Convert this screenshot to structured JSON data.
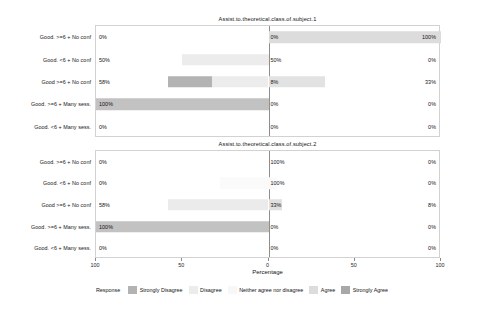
{
  "chart_data": {
    "type": "bar",
    "subtype": "diverging-stacked-likert",
    "title": "",
    "xlabel": "Percentage",
    "ylabel": "",
    "xlim": [
      -100,
      100
    ],
    "xticks": [
      -100,
      -50,
      0,
      50,
      100
    ],
    "xticklabels": [
      "100",
      "50",
      "0",
      "50",
      "100"
    ],
    "grid": false,
    "legend_position": "bottom",
    "legend_title": "Response",
    "categories_legend": [
      "Strongly Disagree",
      "Disagree",
      "Neither agree nor disagree",
      "Agree",
      "Strongly Agree"
    ],
    "colors": {
      "strongly_disagree": "#b3b3b3",
      "disagree": "#ececec",
      "neither": "#f7f7f7",
      "agree": "#dcdcdc",
      "strongly_agree": "#a8a8a8",
      "panel_border": "#d2d2d2",
      "zero_line": "#8e8e8e",
      "background": "#ffffff",
      "text": "#141414"
    },
    "panels": [
      {
        "title": "Assist.to.theoretical.class.of.subject.1",
        "categories": [
          "Good. >=6 + No conf",
          "Good. <6 + No conf",
          "Good >=6 + No conf",
          "Good. >=6 + Many sess.",
          "Good. <6 + Many sess."
        ],
        "rows": [
          {
            "label": "Good. >=6 + No conf",
            "left_pct": "0%",
            "center_pct": "0%",
            "right_pct": "100%",
            "left_value": 0,
            "center_value": 0,
            "right_value": 100,
            "segments": [
              {
                "response": "Agree",
                "start": 0,
                "end": 100,
                "color": "#dcdcdc"
              }
            ]
          },
          {
            "label": "Good. <6 + No conf",
            "left_pct": "50%",
            "center_pct": "50%",
            "right_pct": "0%",
            "left_value": 50,
            "center_value": 50,
            "right_value": 0,
            "segments": [
              {
                "response": "Disagree",
                "start": -50,
                "end": 0,
                "color": "#ececec"
              }
            ]
          },
          {
            "label": "Good >=6 + No conf",
            "left_pct": "58%",
            "center_pct": "8%",
            "right_pct": "33%",
            "left_value": 58,
            "center_value": 8,
            "right_value": 33,
            "segments": [
              {
                "response": "Strongly Disagree",
                "start": -58,
                "end": -33,
                "color": "#b3b3b3"
              },
              {
                "response": "Disagree",
                "start": -33,
                "end": 0,
                "color": "#ececec"
              },
              {
                "response": "Agree",
                "start": 0,
                "end": 33,
                "color": "#e2e2e2"
              }
            ]
          },
          {
            "label": "Good. >=6 + Many sess.",
            "left_pct": "100%",
            "center_pct": "0%",
            "right_pct": "0%",
            "left_value": 100,
            "center_value": 0,
            "right_value": 0,
            "segments": [
              {
                "response": "Strongly Disagree",
                "start": -100,
                "end": 0,
                "color": "#c2c2c2"
              }
            ]
          },
          {
            "label": "Good. <6 + Many sess.",
            "left_pct": "0%",
            "center_pct": "0%",
            "right_pct": "0%",
            "left_value": 0,
            "center_value": 0,
            "right_value": 0,
            "segments": []
          }
        ]
      },
      {
        "title": "Assist.to.theoretical.class.of.subject.2",
        "categories": [
          "Good. >=6 + No conf",
          "Good. <6 + No conf",
          "Good >=6 + No conf",
          "Good. >=6 + Many sess.",
          "Good. <6 + Many sess."
        ],
        "rows": [
          {
            "label": "Good. >=6 + No conf",
            "left_pct": "0%",
            "center_pct": "100%",
            "right_pct": "0%",
            "left_value": 0,
            "center_value": 100,
            "right_value": 0,
            "segments": []
          },
          {
            "label": "Good. <6 + No conf",
            "left_pct": "0%",
            "center_pct": "100%",
            "right_pct": "0%",
            "left_value": 0,
            "center_value": 100,
            "right_value": 0,
            "segments": [
              {
                "response": "Neither agree nor disagree",
                "start": -28,
                "end": 5,
                "color": "#fafafa"
              }
            ]
          },
          {
            "label": "Good >=6 + No conf",
            "left_pct": "58%",
            "center_pct": "33%",
            "right_pct": "8%",
            "left_value": 58,
            "center_value": 33,
            "right_value": 8,
            "segments": [
              {
                "response": "Disagree",
                "start": -58,
                "end": 0,
                "color": "#ebebeb"
              },
              {
                "response": "Agree",
                "start": 0,
                "end": 8,
                "color": "#e0e0e0"
              }
            ]
          },
          {
            "label": "Good. >=6 + Many sess.",
            "left_pct": "100%",
            "center_pct": "0%",
            "right_pct": "0%",
            "left_value": 100,
            "center_value": 0,
            "right_value": 0,
            "segments": [
              {
                "response": "Strongly Disagree",
                "start": -100,
                "end": 0,
                "color": "#c2c2c2"
              }
            ]
          },
          {
            "label": "Good. <6 + Many sess.",
            "left_pct": "0%",
            "center_pct": "0%",
            "right_pct": "0%",
            "left_value": 0,
            "center_value": 0,
            "right_value": 0,
            "segments": []
          }
        ]
      }
    ]
  }
}
